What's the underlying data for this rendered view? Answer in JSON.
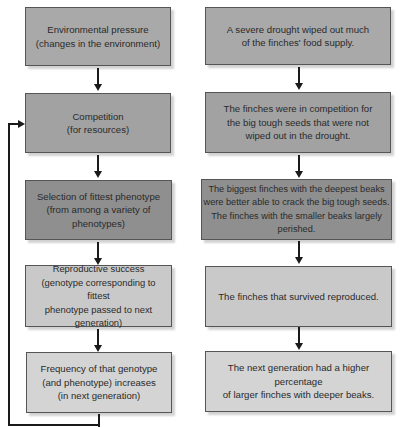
{
  "diagram": {
    "left_column": [
      {
        "id": "environmental-pressure",
        "text": "Environmental pressure\n(changes in the environment)",
        "fill": "#a9a9a9"
      },
      {
        "id": "competition",
        "text": "Competition\n(for resources)",
        "fill": "#a2a2a2"
      },
      {
        "id": "selection",
        "text": "Selection of fittest phenotype\n(from among a variety of phenotypes)",
        "fill": "#8f8f8f"
      },
      {
        "id": "reproductive-success",
        "text": "Reproductive success\n(genotype corresponding to fittest\nphenotype passed to next generation)",
        "fill": "#c9c9c9"
      },
      {
        "id": "frequency-increase",
        "text": "Frequency of that genotype\n(and phenotype) increases\n(in next generation)",
        "fill": "#d4d4d4"
      }
    ],
    "right_column": [
      {
        "id": "drought",
        "text": "A severe drought wiped out much\nof the finches' food supply.",
        "fill": "#a9a9a9"
      },
      {
        "id": "finch-competition",
        "text": "The finches were in competition for\nthe big tough seeds that were not\nwiped out in the drought.",
        "fill": "#a2a2a2"
      },
      {
        "id": "finch-selection",
        "text": "The biggest finches with the deepest beaks\nwere better able to crack the big tough seeds.\nThe finches with the smaller beaks largely perished.",
        "fill": "#8f8f8f"
      },
      {
        "id": "finch-reproduced",
        "text": "The finches that survived reproduced.",
        "fill": "#c9c9c9"
      },
      {
        "id": "next-generation",
        "text": "The next generation had a higher percentage\nof larger finches with deeper beaks.",
        "fill": "#d4d4d4"
      }
    ],
    "feedback_loop": {
      "from": "frequency-increase",
      "to": "competition"
    }
  }
}
